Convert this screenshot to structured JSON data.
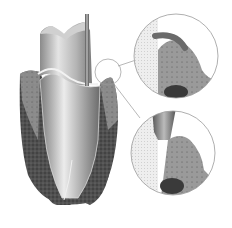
{
  "figure": {
    "parts": {
      "tooth": "tooth-cross-section",
      "probe": "periodontal-probe",
      "bone": "alveolar-bone",
      "gum": "gingiva",
      "callout_top": "magnified-view-healthy-sulcus",
      "callout_bottom": "magnified-view-probe-in-pocket"
    },
    "colors": {
      "background": "#ffffff",
      "bone": "#4a4a4a",
      "tooth_light": "#e6e6e6",
      "tooth_mid": "#a8a8a8",
      "tooth_dark": "#6e6e6e",
      "gum": "#8c8c8c",
      "probe": "#7a7a7a",
      "outline": "#9a9a9a"
    }
  }
}
